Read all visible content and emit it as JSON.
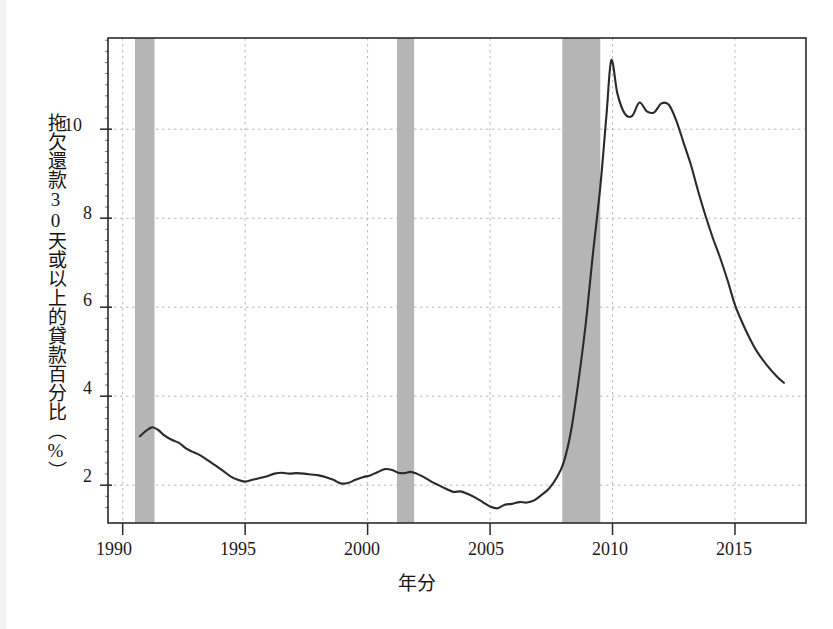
{
  "chart_data": {
    "type": "line",
    "title": "",
    "xlabel": "年分",
    "ylabel": "拖欠還款30天或以上的貸款百分比（%）",
    "xlim": [
      1989.4,
      2017.9
    ],
    "ylim": [
      1.15,
      12.05
    ],
    "grid": true,
    "legend": null,
    "ytick_labels": [
      "2",
      "4",
      "6",
      "8",
      "10"
    ],
    "ytick_values": [
      2,
      4,
      6,
      8,
      10
    ],
    "xtick_labels": [
      "1990",
      "1995",
      "2000",
      "2005",
      "2010",
      "2015"
    ],
    "xtick_values": [
      1990,
      1995,
      2000,
      2005,
      2010,
      2015
    ],
    "series": [
      {
        "name": "拖欠還款30天或以上的貸款百分比",
        "color": "#2a2a2a",
        "x": [
          1990.7,
          1990.95,
          1991.2,
          1991.45,
          1991.7,
          1992.0,
          1992.3,
          1992.6,
          1992.9,
          1993.2,
          1993.5,
          1993.8,
          1994.1,
          1994.4,
          1994.7,
          1995.0,
          1995.3,
          1995.6,
          1995.9,
          1996.2,
          1996.5,
          1996.8,
          1997.1,
          1997.4,
          1997.7,
          1998.0,
          1998.3,
          1998.6,
          1998.9,
          1999.2,
          1999.5,
          1999.8,
          2000.1,
          2000.4,
          2000.7,
          2001.0,
          2001.25,
          2001.5,
          2001.75,
          2002.0,
          2002.3,
          2002.6,
          2002.9,
          2003.2,
          2003.5,
          2003.8,
          2004.1,
          2004.4,
          2004.7,
          2005.0,
          2005.3,
          2005.6,
          2005.9,
          2006.2,
          2006.5,
          2006.8,
          2007.1,
          2007.4,
          2007.7,
          2008.0,
          2008.3,
          2008.6,
          2008.9,
          2009.2,
          2009.5,
          2009.75,
          2009.95,
          2010.2,
          2010.5,
          2010.8,
          2011.1,
          2011.4,
          2011.7,
          2012.0,
          2012.3,
          2012.6,
          2012.9,
          2013.2,
          2013.5,
          2013.8,
          2014.1,
          2014.4,
          2014.7,
          2015.0,
          2015.3,
          2015.6,
          2015.9,
          2016.3,
          2016.7,
          2017.0
        ],
        "y": [
          3.1,
          3.22,
          3.3,
          3.24,
          3.12,
          3.02,
          2.95,
          2.82,
          2.74,
          2.66,
          2.55,
          2.44,
          2.32,
          2.2,
          2.12,
          2.08,
          2.12,
          2.16,
          2.2,
          2.26,
          2.28,
          2.26,
          2.27,
          2.26,
          2.24,
          2.22,
          2.18,
          2.12,
          2.04,
          2.05,
          2.12,
          2.18,
          2.22,
          2.29,
          2.36,
          2.34,
          2.28,
          2.27,
          2.3,
          2.26,
          2.18,
          2.08,
          2.0,
          1.92,
          1.85,
          1.86,
          1.8,
          1.72,
          1.62,
          1.52,
          1.48,
          1.56,
          1.58,
          1.62,
          1.61,
          1.66,
          1.78,
          1.92,
          2.15,
          2.5,
          3.2,
          4.3,
          5.6,
          7.2,
          8.7,
          10.3,
          11.55,
          10.8,
          10.35,
          10.3,
          10.6,
          10.4,
          10.38,
          10.58,
          10.55,
          10.2,
          9.7,
          9.2,
          8.6,
          8.05,
          7.55,
          7.1,
          6.6,
          6.05,
          5.65,
          5.3,
          5.0,
          4.7,
          4.45,
          4.3
        ]
      }
    ],
    "recession_bands": [
      {
        "start": 1990.5,
        "end": 1991.3
      },
      {
        "start": 1991.3,
        "end": 1991.3
      },
      {
        "start": 2001.2,
        "end": 2001.9
      },
      {
        "start": 2007.95,
        "end": 2009.5
      }
    ],
    "recession_color": "#a8a8a8"
  }
}
